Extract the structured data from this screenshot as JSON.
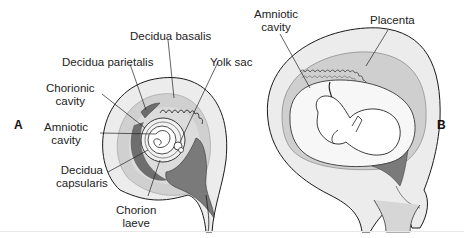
{
  "figure": {
    "panels": [
      {
        "id": "A",
        "letter": "A",
        "labels": {
          "decidua_basalis": "Decidua basalis",
          "decidua_parietalis": "Decidua parietalis",
          "yolk_sac": "Yolk sac",
          "chorionic_cavity_1": "Chorionic",
          "chorionic_cavity_2": "cavity",
          "amniotic_cavity_1": "Amniotic",
          "amniotic_cavity_2": "cavity",
          "decidua_capsularis_1": "Decidua",
          "decidua_capsularis_2": "capsularis",
          "chorion_laeve_1": "Chorion",
          "chorion_laeve_2": "laeve"
        }
      },
      {
        "id": "B",
        "letter": "B",
        "labels": {
          "amniotic_cavity_1": "Amniotic",
          "amniotic_cavity_2": "cavity",
          "placenta": "Placenta"
        }
      }
    ],
    "colors": {
      "outer_wall": "#e9e9e9",
      "mid_layer": "#d2d2d2",
      "dark_layer": "#8a8a8a",
      "darker_layer": "#6e6e6e",
      "outline": "#1a1a1a",
      "cavity": "#f7f7f7"
    }
  }
}
